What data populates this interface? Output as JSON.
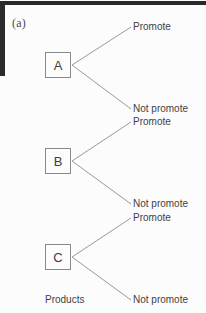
{
  "figure": {
    "label": "(a)",
    "caption": "Products",
    "line_color": "#8d8d8d",
    "box_border_color": "#8a8a8a",
    "text_color": "#3f3f3f",
    "scan_bar_color": "#2b2b2b",
    "background_color": "#fcfcfc"
  },
  "diagram": {
    "type": "decision-tree",
    "root_caption": "Products",
    "nodes": [
      {
        "id": "A",
        "label": "A",
        "branches": [
          {
            "id": "a-promote",
            "label": "Promote"
          },
          {
            "id": "a-not-promote",
            "label": "Not promote"
          }
        ]
      },
      {
        "id": "B",
        "label": "B",
        "branches": [
          {
            "id": "b-promote",
            "label": "Promote"
          },
          {
            "id": "b-not-promote",
            "label": "Not promote"
          }
        ]
      },
      {
        "id": "C",
        "label": "C",
        "branches": [
          {
            "id": "c-promote",
            "label": "Promote"
          },
          {
            "id": "c-not-promote",
            "label": "Not promote"
          }
        ]
      }
    ]
  }
}
